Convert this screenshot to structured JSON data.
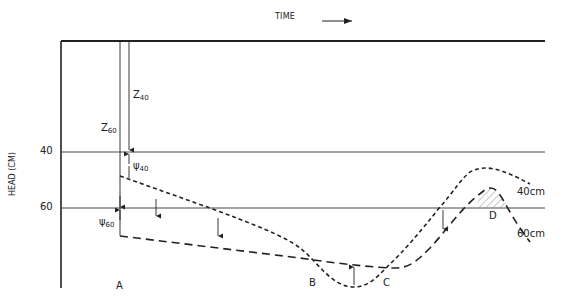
{
  "diagram": {
    "title_axis_x": "TIME",
    "axis_y_label": "HEAD (CM)",
    "ticks": [
      {
        "label": "40",
        "y": 152
      },
      {
        "label": "60",
        "y": 208
      }
    ],
    "symbols": {
      "z40": {
        "base": "Z",
        "sub": "40"
      },
      "z60": {
        "base": "Z",
        "sub": "60"
      },
      "psi40": {
        "base": "ψ",
        "sub": "40"
      },
      "psi60": {
        "base": "ψ",
        "sub": "60"
      }
    },
    "points": [
      "A",
      "B",
      "C",
      "D"
    ],
    "curves": [
      {
        "name": "40cm",
        "label": "40cm",
        "style": "short-dash",
        "color": "#222222"
      },
      {
        "name": "60cm",
        "label": "60cm",
        "style": "long-dash",
        "color": "#222222"
      }
    ],
    "colors": {
      "line": "#222222",
      "hatch": "#888888",
      "background": "#ffffff"
    }
  }
}
